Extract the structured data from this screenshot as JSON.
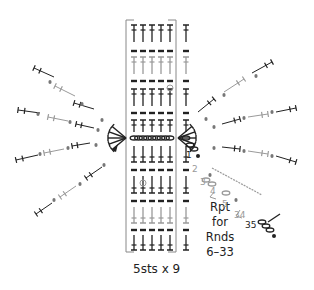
{
  "diagram": {
    "type": "crochet stitch chart",
    "repeat_label": "5sts x 9",
    "repeat_note": {
      "lines": [
        "Rpt",
        "for",
        "Rnds",
        "6–33"
      ]
    },
    "round_numbers": [
      {
        "label": "1",
        "x": 186,
        "y": 150,
        "color": "#222222"
      },
      {
        "label": "2",
        "x": 192,
        "y": 164,
        "color": "#9a9a9a"
      },
      {
        "label": "3",
        "x": 200,
        "y": 177,
        "color": "#9a9a9a"
      },
      {
        "label": "4",
        "x": 210,
        "y": 186,
        "color": "#9a9a9a"
      },
      {
        "label": "5",
        "x": 222,
        "y": 199,
        "color": "#9a9a9a"
      },
      {
        "label": "34",
        "x": 234,
        "y": 210,
        "color": "#9a9a9a"
      },
      {
        "label": "35",
        "x": 245,
        "y": 220,
        "color": "#222222"
      }
    ],
    "colors": {
      "dark": "#222222",
      "light": "#9a9a9a",
      "bracket": "#888888"
    },
    "grid": {
      "columns_in_repeat": 5,
      "extra_columns": 1,
      "row_pattern": [
        "dc",
        "sl",
        "dc-light",
        "sl",
        "dc",
        "sl",
        "dc",
        "ch",
        "dc",
        "sl",
        "dc-light",
        "sl",
        "dc-light",
        "sl",
        "dc"
      ]
    }
  }
}
